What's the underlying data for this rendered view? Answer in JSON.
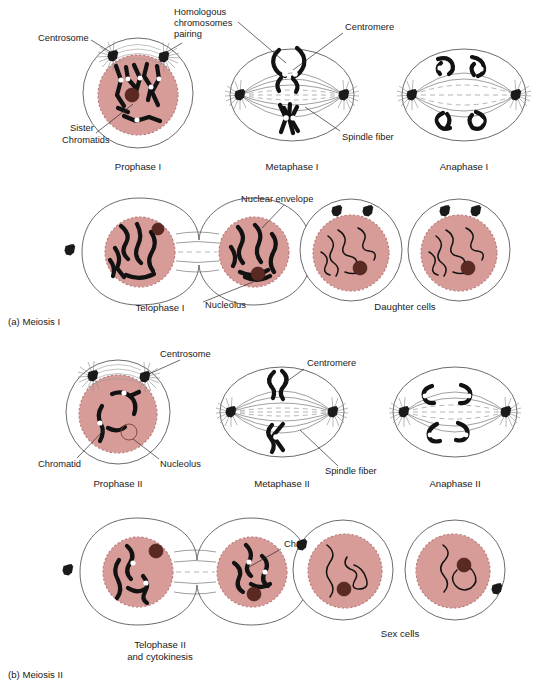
{
  "figure": {
    "title": "Meiosis",
    "width": 542,
    "height": 689,
    "background": "#ffffff"
  },
  "colors": {
    "nucleus_fill": "#d79b98",
    "nucleus_border": "#b97a77",
    "nucleolus": "#5a2a22",
    "chromosome": "#121212",
    "membrane": "#5a5a5a",
    "spindle": "#6b6b6b",
    "text": "#1a1a1a"
  },
  "sections": [
    {
      "id": "meiosis-1",
      "label": "(a) Meiosis I"
    },
    {
      "id": "meiosis-2",
      "label": "(b) Meiosis II"
    }
  ],
  "stages": [
    {
      "id": "prophase-1",
      "label": "Prophase I",
      "row": 1,
      "section": "meiosis-1"
    },
    {
      "id": "metaphase-1",
      "label": "Metaphase I",
      "row": 1,
      "section": "meiosis-1"
    },
    {
      "id": "anaphase-1",
      "label": "Anaphase I",
      "row": 1,
      "section": "meiosis-1"
    },
    {
      "id": "telophase-1",
      "label": "Telophase I",
      "row": 2,
      "section": "meiosis-1"
    },
    {
      "id": "daughter-cells",
      "label": "Daughter cells",
      "row": 2,
      "section": "meiosis-1"
    },
    {
      "id": "prophase-2",
      "label": "Prophase II",
      "row": 3,
      "section": "meiosis-2"
    },
    {
      "id": "metaphase-2",
      "label": "Metaphase II",
      "row": 3,
      "section": "meiosis-2"
    },
    {
      "id": "anaphase-2",
      "label": "Anaphase II",
      "row": 3,
      "section": "meiosis-2"
    },
    {
      "id": "telophase-2",
      "label": "Telophase II",
      "label_line2": "and cytokinesis",
      "row": 4,
      "section": "meiosis-2"
    },
    {
      "id": "sex-cells",
      "label": "Sex cells",
      "row": 4,
      "section": "meiosis-2"
    }
  ],
  "callouts": [
    {
      "id": "centrosome-1",
      "text": "Centrosome",
      "stage": "prophase-1"
    },
    {
      "id": "homologous-1",
      "text": "Homologous",
      "stage": "prophase-1"
    },
    {
      "id": "homologous-2",
      "text": "chromosomes",
      "stage": "prophase-1"
    },
    {
      "id": "homologous-3",
      "text": "pairing",
      "stage": "prophase-1"
    },
    {
      "id": "sister-1",
      "text": "Sister",
      "stage": "prophase-1"
    },
    {
      "id": "sister-2",
      "text": "Chromatids",
      "stage": "prophase-1"
    },
    {
      "id": "centromere-1",
      "text": "Centromere",
      "stage": "metaphase-1"
    },
    {
      "id": "spindle-fiber-1",
      "text": "Spindle fiber",
      "stage": "metaphase-1"
    },
    {
      "id": "nuclear-envelope",
      "text": "Nuclear envelope",
      "stage": "telophase-1"
    },
    {
      "id": "nucleolus-1",
      "text": "Nucleolus",
      "stage": "telophase-1"
    },
    {
      "id": "centrosome-2",
      "text": "Centrosome",
      "stage": "prophase-2"
    },
    {
      "id": "chromatid",
      "text": "Chromatid",
      "stage": "prophase-2"
    },
    {
      "id": "nucleolus-2",
      "text": "Nucleolus",
      "stage": "prophase-2"
    },
    {
      "id": "centromere-2",
      "text": "Centromere",
      "stage": "metaphase-2"
    },
    {
      "id": "spindle-fiber-2",
      "text": "Spindle fiber",
      "stage": "metaphase-2"
    },
    {
      "id": "chromosome",
      "text": "Chromosome",
      "stage": "telophase-2"
    }
  ]
}
